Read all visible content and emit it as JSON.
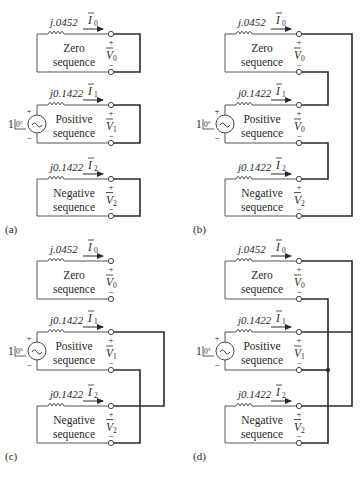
{
  "figure": {
    "panels": [
      {
        "id": "a",
        "caption": "(a)",
        "connection": "open — each sequence network shown separately",
        "networks": [
          {
            "name": "Zero",
            "line2": "sequence",
            "impedance": "j.0452",
            "current": "I",
            "current_sub": "0",
            "voltage": "V",
            "voltage_sub": "0",
            "source": false
          },
          {
            "name": "Positive",
            "line2": "sequence",
            "impedance": "j0.1422",
            "current": "I",
            "current_sub": "1",
            "voltage": "V",
            "voltage_sub": "1",
            "source": true
          },
          {
            "name": "Negative",
            "line2": "sequence",
            "impedance": "j0.1422",
            "current": "I",
            "current_sub": "2",
            "voltage": "V",
            "voltage_sub": "2",
            "source": false
          }
        ]
      },
      {
        "id": "b",
        "caption": "(b)",
        "connection": "series connection of zero, positive and negative networks",
        "networks": [
          {
            "name": "Zero",
            "line2": "sequence",
            "impedance": "j.0452",
            "current": "I",
            "current_sub": "0",
            "voltage": "V",
            "voltage_sub": "0",
            "source": false
          },
          {
            "name": "Positive",
            "line2": "sequence",
            "impedance": "j0.1422",
            "current": "I",
            "current_sub": "1",
            "voltage": "V",
            "voltage_sub": "0",
            "source": true
          },
          {
            "name": "Negative",
            "line2": "sequence",
            "impedance": "j0.1422",
            "current": "I",
            "current_sub": "2",
            "voltage": "V",
            "voltage_sub": "2",
            "source": false
          }
        ]
      },
      {
        "id": "c",
        "caption": "(c)",
        "connection": "positive and negative networks in parallel; zero open",
        "networks": [
          {
            "name": "Zero",
            "line2": "sequence",
            "impedance": "j.0452",
            "current": "I",
            "current_sub": "0",
            "voltage": "V",
            "voltage_sub": "0",
            "source": false
          },
          {
            "name": "Positive",
            "line2": "sequence",
            "impedance": "j0.1422",
            "current": "I",
            "current_sub": "1",
            "voltage": "V",
            "voltage_sub": "1",
            "source": true
          },
          {
            "name": "Negative",
            "line2": "sequence",
            "impedance": "j0.1422",
            "current": "I",
            "current_sub": "2",
            "voltage": "V",
            "voltage_sub": "2",
            "source": false
          }
        ]
      },
      {
        "id": "d",
        "caption": "(d)",
        "connection": "all three networks in parallel",
        "networks": [
          {
            "name": "Zero",
            "line2": "sequence",
            "impedance": "j.0452",
            "current": "I",
            "current_sub": "0",
            "voltage": "V",
            "voltage_sub": "0",
            "source": false
          },
          {
            "name": "Positive",
            "line2": "sequence",
            "impedance": "j0.1422",
            "current": "I",
            "current_sub": "1",
            "voltage": "V",
            "voltage_sub": "1",
            "source": true
          },
          {
            "name": "Negative",
            "line2": "sequence",
            "impedance": "j0.1422",
            "current": "I",
            "current_sub": "2",
            "voltage": "V",
            "voltage_sub": "2",
            "source": false
          }
        ]
      }
    ],
    "source": {
      "magnitude": "1",
      "angle": "0°",
      "plus": "+",
      "minus": "−",
      "symbol": "~"
    },
    "terminal_signs": {
      "plus": "+",
      "minus": "−"
    }
  }
}
